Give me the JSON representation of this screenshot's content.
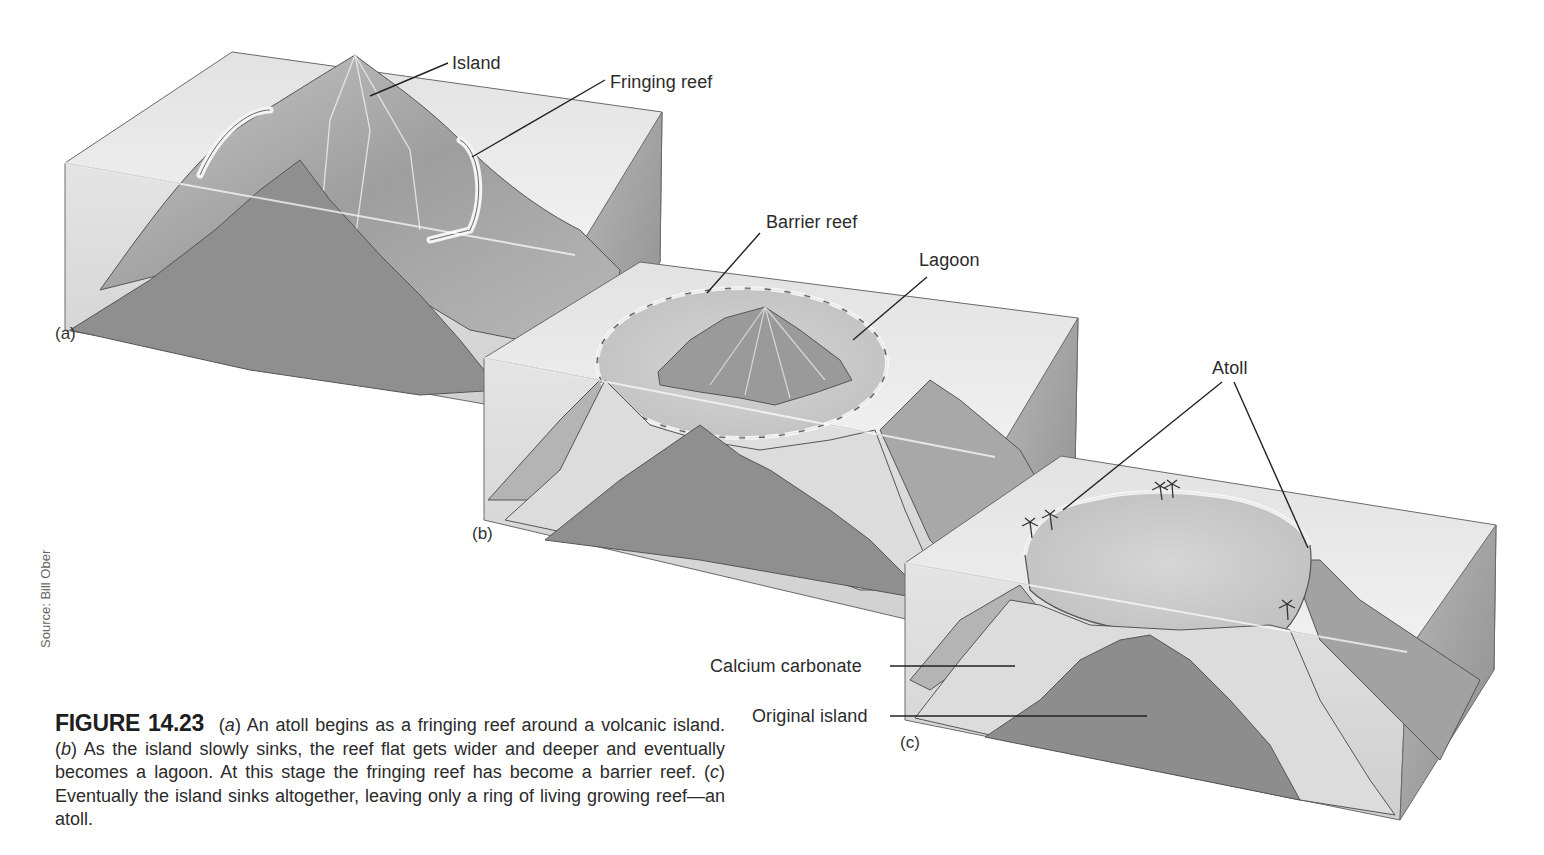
{
  "figure": {
    "number": "FIGURE 14.23",
    "caption_parts": {
      "a_marker": "(a)",
      "a_letter": "a",
      "a_text": " An atoll begins as a fringing reef around a volcanic island. ",
      "b_letter": "b",
      "b_text": " As the island slowly sinks, the reef flat gets wider and deeper and eventually becomes a lagoon. At this stage the fringing reef has become a barrier reef. ",
      "c_letter": "c",
      "c_text": " Eventually the island sinks altogether, leaving only a ring of living growing reef—an atoll."
    },
    "source": "Source: Bill Ober"
  },
  "panels": {
    "a": {
      "tag": "(a)",
      "labels": {
        "island": "Island",
        "fringing_reef": "Fringing reef"
      }
    },
    "b": {
      "tag": "(b)",
      "labels": {
        "barrier_reef": "Barrier reef",
        "lagoon": "Lagoon"
      }
    },
    "c": {
      "tag": "(c)",
      "labels": {
        "atoll": "Atoll",
        "calcium_carbonate": "Calcium carbonate",
        "original_island": "Original island"
      }
    }
  },
  "colors": {
    "water_top": "#e9e9e9",
    "water_side": "#d2d2d2",
    "rock_cut": "#8f8f8f",
    "rock_slope": "#a9a9a9",
    "reef": "#dcdcdc",
    "outline": "#555555"
  }
}
